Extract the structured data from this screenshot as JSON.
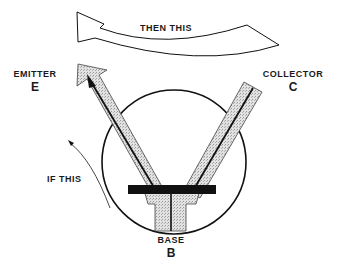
{
  "diagram": {
    "top_arrow_label": "THEN THIS",
    "side_arrow_label": "IF THIS",
    "emitter": {
      "name": "EMITTER",
      "symbol": "E"
    },
    "collector": {
      "name": "COLLECTOR",
      "symbol": "C"
    },
    "base": {
      "name": "BASE",
      "symbol": "B"
    },
    "colors": {
      "line": "#111111",
      "fill_stipple": "#d4d4d4",
      "background": "#ffffff"
    }
  }
}
